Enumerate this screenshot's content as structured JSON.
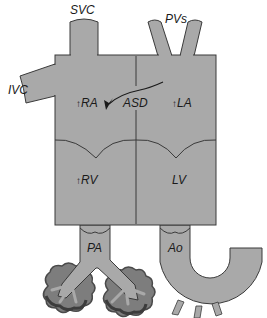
{
  "diagram": {
    "colors": {
      "tissue": "#a9a9a9",
      "outline": "#3a3a3a",
      "lung": "#7d7d7d",
      "lung_dark": "#4a4a4a",
      "background": "#ffffff"
    },
    "labels": {
      "svc": "SVC",
      "pvs": "PVs",
      "ivc": "IVC",
      "ra": "RA",
      "asd": "ASD",
      "la": "LA",
      "rv": "RV",
      "lv": "LV",
      "pa": "PA",
      "ao": "Ao"
    },
    "indicators": {
      "ra_arrow": "↑",
      "la_arrow": "↑",
      "rv_arrow": "↑"
    }
  }
}
